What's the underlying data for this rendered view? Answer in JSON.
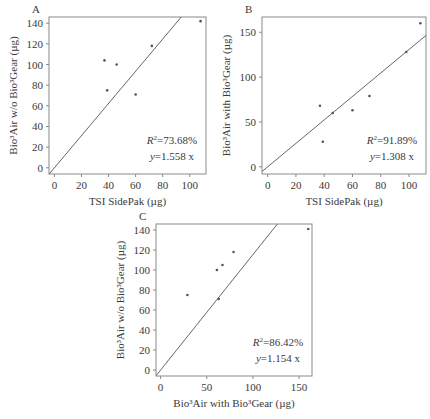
{
  "chart_data": [
    {
      "id": "A",
      "type": "scatter",
      "panel_label": "A",
      "xlabel": "TSI SidePak (µg)",
      "ylabel": "Bio³Air w/o Bio³Gear (µg)",
      "xticks": [
        0,
        20,
        40,
        60,
        80,
        100
      ],
      "yticks": [
        0,
        20,
        40,
        60,
        80,
        100,
        120,
        140
      ],
      "xlim": [
        -4,
        112
      ],
      "ylim": [
        -6,
        146
      ],
      "points": [
        [
          37,
          104
        ],
        [
          46,
          100
        ],
        [
          39,
          75
        ],
        [
          60,
          71
        ],
        [
          72,
          118
        ],
        [
          108,
          142
        ]
      ],
      "fit": {
        "slope": 1.558,
        "intercept": 0
      },
      "annotation": {
        "r2": "=73.68%",
        "eq": "=1.558 x"
      },
      "grid": false,
      "box": {
        "x": 49,
        "y": 17,
        "w": 157,
        "h": 157
      }
    },
    {
      "id": "B",
      "type": "scatter",
      "panel_label": "B",
      "xlabel": "TSI SidePak (µg)",
      "ylabel": "Bio³Air with Bio³Gear (µg)",
      "xticks": [
        0,
        20,
        40,
        60,
        80,
        100
      ],
      "yticks": [
        0,
        50,
        100,
        150
      ],
      "xlim": [
        -4,
        112
      ],
      "ylim": [
        -8,
        167
      ],
      "points": [
        [
          37,
          68
        ],
        [
          39,
          28
        ],
        [
          46,
          60
        ],
        [
          60,
          63
        ],
        [
          72,
          79
        ],
        [
          98,
          128
        ],
        [
          108,
          160
        ]
      ],
      "fit": {
        "slope": 1.308,
        "intercept": 0
      },
      "annotation": {
        "r2": "=91.89%",
        "eq": "=1.308 x"
      },
      "grid": false,
      "box": {
        "x": 262,
        "y": 17,
        "w": 164,
        "h": 157
      }
    },
    {
      "id": "C",
      "type": "scatter",
      "panel_label": "C",
      "xlabel": "Bio³Air with Bio³Gear (µg)",
      "ylabel": "Bio³Air w/o Bio³Gear (µg)",
      "xticks": [
        0,
        50,
        100,
        150
      ],
      "yticks": [
        0,
        20,
        40,
        60,
        80,
        100,
        120,
        140
      ],
      "xlim": [
        -5,
        164
      ],
      "ylim": [
        -6,
        146
      ],
      "points": [
        [
          29,
          75
        ],
        [
          61,
          100
        ],
        [
          67,
          105
        ],
        [
          79,
          118
        ],
        [
          63,
          71
        ],
        [
          160,
          141
        ]
      ],
      "fit": {
        "slope": 1.154,
        "intercept": 0
      },
      "annotation": {
        "r2": "=86.42%",
        "eq": "=1.154 x"
      },
      "grid": false,
      "box": {
        "x": 156,
        "y": 224,
        "w": 156,
        "h": 152
      }
    }
  ]
}
